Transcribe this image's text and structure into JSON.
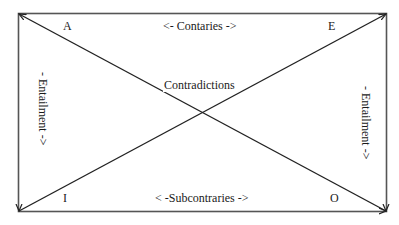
{
  "diagram": {
    "corners": {
      "top_left": "A",
      "top_right": "E",
      "bottom_left": "I",
      "bottom_right": "O"
    },
    "edges": {
      "top": "<- Contaries ->",
      "bottom": "< -Subcontraries ->",
      "left": "- Entailment ->",
      "right": "- Entailment ->"
    },
    "center": "Contradictions",
    "colors": {
      "line": "#333333",
      "background": "#ffffff",
      "text": "#1a1a1a"
    }
  }
}
